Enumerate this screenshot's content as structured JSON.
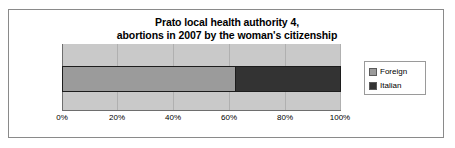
{
  "chart_data": {
    "type": "bar",
    "orientation": "horizontal",
    "stacked": true,
    "title": "Prato local health authority 4, abortions in 2007 by the woman's citizenship",
    "title_lines": [
      "Prato local health authority 4,",
      "abortions in 2007 by the woman's citizenship"
    ],
    "categories": [
      ""
    ],
    "series": [
      {
        "name": "Foreign",
        "values": [
          62
        ],
        "color": "#9b9b9b"
      },
      {
        "name": "Italian",
        "values": [
          38
        ],
        "color": "#333333"
      }
    ],
    "xlabel": "",
    "ylabel": "",
    "xlim": [
      0,
      100
    ],
    "x_ticks": [
      "0%",
      "20%",
      "40%",
      "60%",
      "80%",
      "100%"
    ],
    "x_tick_values": [
      0,
      20,
      40,
      60,
      80,
      100
    ],
    "grid": true,
    "legend_position": "right",
    "plot_background": "#c9c9c9",
    "frame_border_color": "#8a8a8a"
  },
  "legend": {
    "items": [
      {
        "label": "Foreign"
      },
      {
        "label": "Italian"
      }
    ]
  }
}
